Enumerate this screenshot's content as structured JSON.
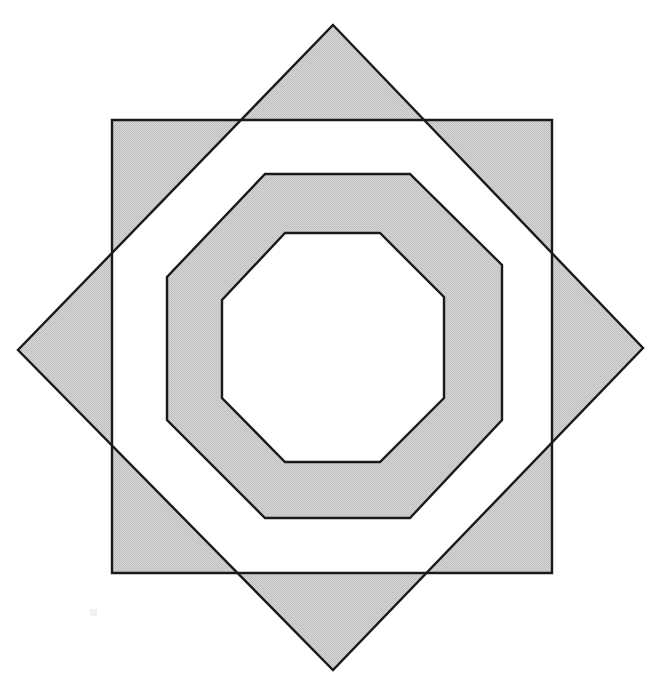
{
  "figure": {
    "title": "Overlapping square, rotated square and two concentric octagons",
    "canvas": {
      "width": 655,
      "height": 679,
      "background": "#ffffff"
    },
    "style": {
      "fill": "#cccccc",
      "fill_name": "light-gray-halftone",
      "stroke": "#1a1a1a",
      "stroke_width": 2.4,
      "fill_rule": "evenodd"
    },
    "shapes": [
      {
        "name": "outer-square",
        "type": "square",
        "points": [
          [
            112,
            120
          ],
          [
            552,
            120
          ],
          [
            552,
            573
          ],
          [
            112,
            573
          ]
        ]
      },
      {
        "name": "rotated-square-diamond",
        "type": "square-rotated-45",
        "points": [
          [
            333,
            25
          ],
          [
            643,
            348
          ],
          [
            333,
            670
          ],
          [
            18,
            350
          ]
        ]
      },
      {
        "name": "outer-octagon",
        "type": "octagon",
        "points": [
          [
            265,
            174
          ],
          [
            410,
            174
          ],
          [
            502,
            265
          ],
          [
            502,
            420
          ],
          [
            410,
            518
          ],
          [
            265,
            518
          ],
          [
            167,
            420
          ],
          [
            167,
            277
          ]
        ]
      },
      {
        "name": "inner-octagon",
        "type": "octagon",
        "points": [
          [
            285,
            233
          ],
          [
            380,
            233
          ],
          [
            444,
            297
          ],
          [
            444,
            398
          ],
          [
            380,
            462
          ],
          [
            285,
            462
          ],
          [
            222,
            398
          ],
          [
            222,
            300
          ]
        ]
      }
    ],
    "artifact": {
      "name": "scan-speck",
      "x": 90,
      "y": 609,
      "width": 7,
      "height": 7,
      "color": "#efefef"
    }
  }
}
